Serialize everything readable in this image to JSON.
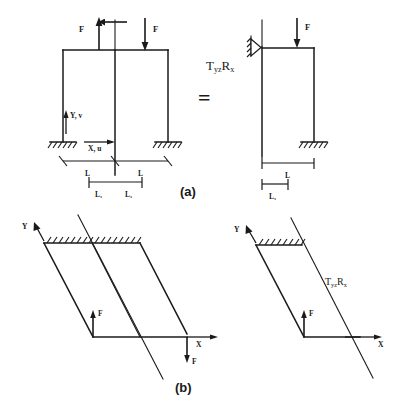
{
  "figure": {
    "background_color": "#ffffff",
    "line_color": "#1a1a1a",
    "width": 405,
    "height": 414
  },
  "equals_sign": "=",
  "part_a": {
    "label": "(a)",
    "full_model": {
      "force_left_label": "F",
      "force_left_direction": "up",
      "force_right_label": "F",
      "force_right_direction": "down",
      "axis_y_label": "Y, v",
      "axis_x_label": "X, u",
      "dim_left_label": "L",
      "dim_right_label": "L",
      "dim_inner_left_label": "L₁",
      "dim_inner_right_label": "L₁",
      "support_left": "fixed-ground",
      "support_right": "fixed-ground",
      "columns": 3
    },
    "half_model": {
      "force_label": "F",
      "force_direction": "down",
      "boundary_condition": "T_yz R_x",
      "bc_text": "T",
      "bc_sub1": "yz",
      "bc_text2": "R",
      "bc_sub2": "x",
      "dim_label": "L",
      "dim_inner_label": "L₁",
      "support_symmetry": "roller-symmetry",
      "support_right": "fixed-ground",
      "columns": 2
    }
  },
  "part_b": {
    "label": "(b)",
    "full_model": {
      "axis_y_label": "Y",
      "axis_x_label": "X",
      "force_inner_label": "F",
      "force_inner_direction": "up",
      "force_outer_label": "F",
      "force_outer_direction": "down",
      "support": "hatched-fixed"
    },
    "half_model": {
      "axis_y_label": "Y",
      "axis_x_label": "X",
      "force_label": "F",
      "force_direction": "up",
      "boundary_condition": "T_yz R_x",
      "bc_text": "T",
      "bc_sub1": "yz",
      "bc_text2": "R",
      "bc_sub2": "x",
      "support": "hatched-fixed"
    }
  }
}
